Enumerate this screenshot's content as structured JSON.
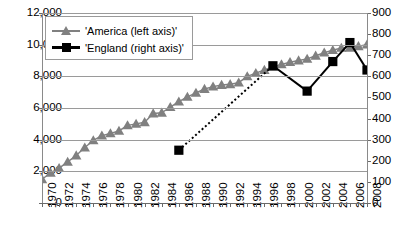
{
  "chart_data": {
    "type": "line",
    "title": "",
    "xlabel": "",
    "ylabel": "",
    "grid": true,
    "legend_position": "top-left",
    "x": [
      1970,
      1971,
      1972,
      1973,
      1974,
      1975,
      1976,
      1977,
      1978,
      1979,
      1980,
      1981,
      1982,
      1983,
      1984,
      1985,
      1986,
      1987,
      1988,
      1989,
      1990,
      1991,
      1992,
      1993,
      1994,
      1995,
      1996,
      1997,
      1998,
      1999,
      2000,
      2001,
      2002,
      2003,
      2004,
      2005,
      2006,
      2007,
      2008
    ],
    "xtick_labels": [
      "1970",
      "1972",
      "1974",
      "1976",
      "1978",
      "1980",
      "1982",
      "1984",
      "1986",
      "1988",
      "1990",
      "1992",
      "1994",
      "1996",
      "1998",
      "2000",
      "2002",
      "2004",
      "2006",
      "2008"
    ],
    "xtick_values": [
      1970,
      1972,
      1974,
      1976,
      1978,
      1980,
      1982,
      1984,
      1986,
      1988,
      1990,
      1992,
      1994,
      1996,
      1998,
      2000,
      2002,
      2004,
      2006,
      2008
    ],
    "xlim": [
      1970,
      2008
    ],
    "axes": [
      {
        "id": "left",
        "label": "",
        "ylim": [
          0,
          12000
        ],
        "ticks": [
          0,
          2000,
          4000,
          6000,
          8000,
          10000,
          12000
        ],
        "tick_labels": [
          "0",
          "2,000",
          "4,000",
          "6,000",
          "8,000",
          "10,000",
          "12,000"
        ]
      },
      {
        "id": "right",
        "label": "",
        "ylim": [
          0,
          900
        ],
        "ticks": [
          0,
          100,
          200,
          300,
          400,
          500,
          600,
          700,
          800,
          900
        ],
        "tick_labels": [
          "0",
          "100",
          "200",
          "300",
          "400",
          "500",
          "600",
          "700",
          "800",
          "900"
        ]
      }
    ],
    "series": [
      {
        "name": "'America (left axis)'",
        "axis": "left",
        "color": "#808080",
        "marker": "triangle",
        "linestyle": "solid",
        "x": [
          1970,
          1971,
          1972,
          1973,
          1974,
          1975,
          1976,
          1977,
          1978,
          1979,
          1980,
          1981,
          1982,
          1983,
          1984,
          1985,
          1986,
          1987,
          1988,
          1989,
          1990,
          1991,
          1992,
          1993,
          1994,
          1995,
          1996,
          1997,
          1998,
          1999,
          2000,
          2001,
          2002,
          2003,
          2004,
          2005,
          2006,
          2007,
          2008
        ],
        "values": [
          1500,
          1900,
          2200,
          2600,
          3000,
          3500,
          3950,
          4250,
          4400,
          4550,
          4900,
          5000,
          5100,
          5650,
          5700,
          6050,
          6400,
          6700,
          6950,
          7200,
          7350,
          7450,
          7500,
          7600,
          8000,
          8200,
          8400,
          8600,
          8750,
          8900,
          9000,
          9100,
          9300,
          9500,
          9650,
          9800,
          9800,
          9900,
          10000
        ]
      },
      {
        "name": "'England (right axis)'",
        "axis": "right",
        "color": "#000000",
        "marker": "square",
        "linestyle": "dotted-then-solid",
        "x": [
          1986,
          1997,
          2001,
          2004,
          2006,
          2008
        ],
        "values": [
          250,
          650,
          530,
          670,
          760,
          630
        ],
        "dotted_segments": [
          [
            1986,
            1997
          ]
        ]
      }
    ]
  },
  "legend": {
    "items": [
      {
        "label": "'America (left axis)'",
        "marker": "triangle",
        "color": "#808080"
      },
      {
        "label": "'England (right axis)'",
        "marker": "square",
        "color": "#000000"
      }
    ]
  }
}
